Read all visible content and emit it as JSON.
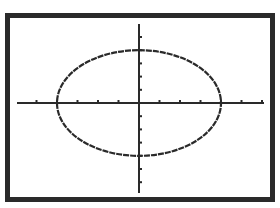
{
  "chart_data": {
    "type": "line",
    "title": "",
    "equation_form": "x^2/a^2 + y^2/b^2 = 1",
    "center": [
      0,
      0
    ],
    "semi_axis_x_ticks": 4,
    "semi_axis_y_ticks": 4,
    "x_tick_count_each_side": 6,
    "y_tick_count_each_side": 6,
    "xlim": [
      -6,
      6
    ],
    "ylim": [
      -6,
      6
    ],
    "grid": false,
    "legend": null,
    "xlabel": "",
    "ylabel": ""
  },
  "colors": {
    "frame": "#2a2a2a",
    "curve": "#2a2a2a",
    "axis": "#2a2a2a",
    "background": "#ffffff"
  }
}
